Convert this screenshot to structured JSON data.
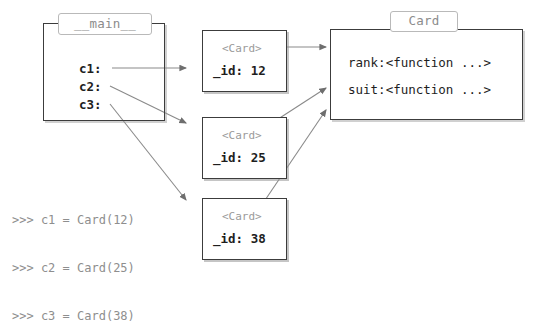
{
  "diagram": {
    "type": "python-object-reference-diagram",
    "main_frame": {
      "name": "__main__",
      "variables": [
        {
          "label": "c1:"
        },
        {
          "label": "c2:"
        },
        {
          "label": "c3:"
        }
      ]
    },
    "instances": [
      {
        "type_label": "<Card>",
        "attr": "_id: 12"
      },
      {
        "type_label": "<Card>",
        "attr": "_id: 25"
      },
      {
        "type_label": "<Card>",
        "attr": "_id: 38"
      }
    ],
    "class_frame": {
      "name": "Card",
      "attributes": [
        "rank:<function ...>",
        "suit:<function ...>"
      ]
    },
    "console": {
      "lines": [
        ">>> c1 = Card(12)",
        ">>> c2 = Card(25)",
        ">>> c3 = Card(38)"
      ]
    },
    "colors": {
      "frame_border": "#3c3c3c",
      "tag_border": "#b9b9b9",
      "tag_text": "#8c8c8c",
      "body_text": "#1e1e1e",
      "muted_text": "#9a9a9a",
      "console_text": "#8e8e8e",
      "arrow": "#6e6e6e",
      "background": "#ffffff"
    }
  }
}
